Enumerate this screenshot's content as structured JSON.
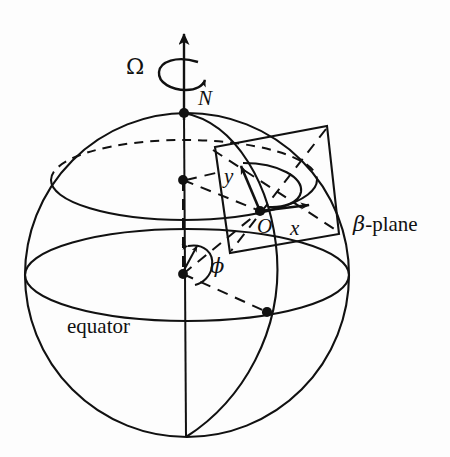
{
  "figure": {
    "background_color": "#fdfdfd",
    "ink_color": "#111111"
  },
  "labels": {
    "omega": "Ω",
    "north_pole": "N",
    "y_axis": "y",
    "x_axis": "x",
    "origin": "O",
    "phi": "ϕ",
    "equator": "equator",
    "beta_plane_symbol": "β",
    "beta_plane_suffix": "-plane"
  },
  "icons": {
    "rotation_axis": "up-arrow-icon",
    "rotation_spin": "curved-rotation-arrow-icon",
    "x_axis_arrow": "x-axis-arrow-icon",
    "y_axis_arrow": "y-axis-arrow-icon",
    "phi_angle_arc": "angle-arc-icon",
    "north_pole_marker": "point-marker-icon",
    "origin_marker": "point-marker-icon",
    "sphere_center_marker": "point-marker-icon",
    "latitude_center_marker": "point-marker-icon",
    "equator_point_marker": "point-marker-icon"
  },
  "geometry": {
    "sphere": {
      "cx": 187,
      "cy": 275,
      "r": 162
    },
    "north_pole": {
      "x": 184,
      "y": 113
    },
    "south_pole": {
      "x": 186,
      "y": 437
    },
    "sphere_center": {
      "x": 183,
      "y": 274
    },
    "latitude_center": {
      "x": 183,
      "y": 180
    },
    "origin_O": {
      "x": 260,
      "y": 211
    },
    "equator_point": {
      "x": 267,
      "y": 312
    },
    "axis_arrow_tip": {
      "x": 184,
      "y": 30
    },
    "beta_plane_corners": [
      {
        "x": 215,
        "y": 147
      },
      {
        "x": 327,
        "y": 126
      },
      {
        "x": 339,
        "y": 234
      },
      {
        "x": 230,
        "y": 253
      }
    ],
    "x_arrow_tip": {
      "x": 315,
      "y": 205
    },
    "y_arrow_tip": {
      "x": 240,
      "y": 161
    }
  }
}
